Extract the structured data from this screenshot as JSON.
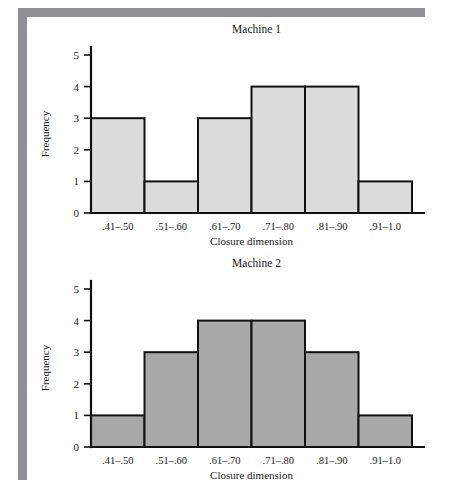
{
  "chart_data": [
    {
      "type": "bar",
      "title": "Machine 1",
      "xlabel": "Closure dimension",
      "ylabel": "Frequency",
      "categories": [
        ".41–.50",
        ".51–.60",
        ".61–.70",
        ".71–.80",
        ".81–.90",
        ".91–1.0"
      ],
      "values": [
        3,
        1,
        3,
        4,
        4,
        1
      ],
      "ylim": [
        0,
        5
      ],
      "yticks": [
        "0",
        "1",
        "2",
        "3",
        "4",
        "5"
      ],
      "grid": false,
      "legend": "none",
      "bar_fill": "#dcdcdc",
      "bar_stroke": "#111111"
    },
    {
      "type": "bar",
      "title": "Machine 2",
      "xlabel": "Closure dimension",
      "ylabel": "Frequency",
      "categories": [
        ".41–.50",
        ".51–.60",
        ".61–.70",
        ".71–.80",
        ".81–.90",
        ".91–1.0"
      ],
      "values": [
        1,
        3,
        4,
        4,
        3,
        1
      ],
      "ylim": [
        0,
        5
      ],
      "yticks": [
        "0",
        "1",
        "2",
        "3",
        "4",
        "5"
      ],
      "grid": false,
      "legend": "none",
      "bar_fill": "#a8a8a8",
      "bar_stroke": "#111111"
    }
  ]
}
